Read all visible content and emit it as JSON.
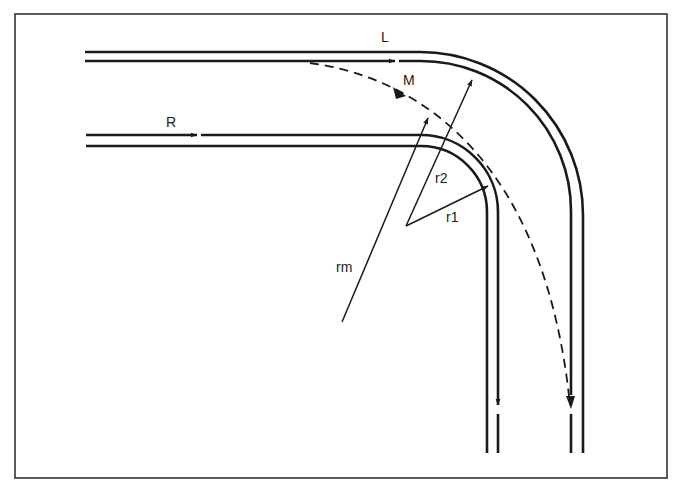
{
  "diagram": {
    "type": "railway curve radius diagram",
    "frame": {
      "x": 15,
      "y": 14,
      "width": 652,
      "height": 464
    },
    "colors": {
      "line": "#1a1a1a",
      "background": "#ffffff",
      "frame": "#333333"
    },
    "tracks": [
      {
        "id": "L",
        "label": "L",
        "description": "outer track, large radius curve"
      },
      {
        "id": "R",
        "label": "R",
        "description": "inner track, small radius curve"
      },
      {
        "id": "M",
        "label": "M",
        "description": "dashed path between tracks, medium radius"
      }
    ],
    "radii": [
      {
        "id": "r1",
        "label": "r1",
        "description": "radius of inner track R"
      },
      {
        "id": "r2",
        "label": "r2",
        "description": "radius of outer track L"
      },
      {
        "id": "rm",
        "label": "rm",
        "description": "radius of dashed path M"
      }
    ],
    "labels": {
      "L": "L",
      "M": "M",
      "R": "R",
      "r1": "r1",
      "r2": "r2",
      "rm": "rm"
    }
  }
}
